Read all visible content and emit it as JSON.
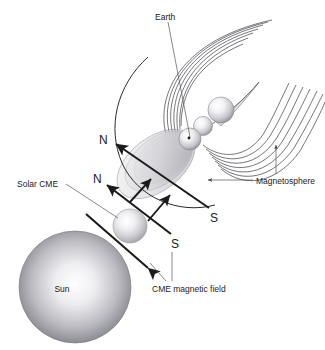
{
  "figure": {
    "domain": "diagram",
    "background_color": "#ffffff",
    "width": 325,
    "height": 350,
    "line_color": "#2b2b2b",
    "leader_color": "#555555",
    "field_line_color": "#4a4a52",
    "lobe_stroke_color": "#6d6d75"
  },
  "labels": {
    "earth": "Earth",
    "magnetosphere": "Magnetosphere",
    "solar_cme": "Solar CME",
    "cme_magnetic_field": "CME magnetic field",
    "sun": "Sun",
    "pole_n_upper": "N",
    "pole_n_lower": "N",
    "pole_s_upper": "S",
    "pole_s_lower": "S"
  },
  "objects": {
    "sun": {
      "name": "Sun",
      "cx": 75,
      "cy": 287,
      "r": 56,
      "fill_light": "#fdfdfd",
      "fill_dark": "#6f6f74"
    },
    "cme_cloud": {
      "name": "Solar CME",
      "cx": 130,
      "cy": 226,
      "r": 17,
      "fill_light": "#fbfbfb",
      "fill_dark": "#9b9ba2"
    },
    "earth": {
      "name": "Earth",
      "cx": 190,
      "cy": 139,
      "r": 11,
      "fill_light": "#fcfcfc",
      "fill_dark": "#8a8a90"
    },
    "plasmoid_mid": {
      "cx": 203,
      "cy": 126,
      "r": 9.5,
      "fill_light": "#fcfcfc",
      "fill_dark": "#8f8f95"
    },
    "plasmoid_outer": {
      "cx": 221,
      "cy": 110,
      "r": 13,
      "fill_light": "#fcfcfc",
      "fill_dark": "#8f8f95"
    }
  },
  "counts": {
    "northern_field_lines": 7,
    "tail_field_lines": 7,
    "magnetosphere_lobes": 7,
    "cme_field_arrows": 2,
    "transverse_arrows": 2
  }
}
